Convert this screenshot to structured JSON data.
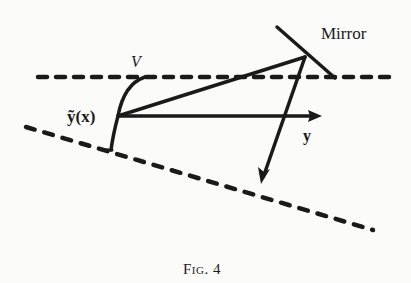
{
  "figure": {
    "caption": "Fig. 4",
    "labels": {
      "mirror": "Mirror",
      "curve": "V",
      "point": "ỹ(x)",
      "axis": "y"
    },
    "colors": {
      "ink": "#1a1a1a",
      "paper": "#fbfbfa"
    }
  }
}
